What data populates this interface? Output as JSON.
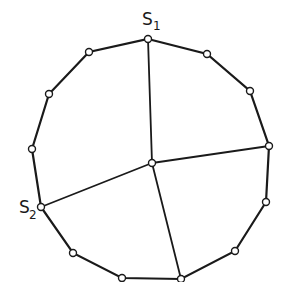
{
  "diagram": {
    "type": "planar-graph",
    "colors": {
      "line": "#1a1a1a",
      "vertex_fill": "#ffffff",
      "background": "#ffffff"
    },
    "labels": {
      "s1": {
        "main": "S",
        "sub": "1"
      },
      "s2": {
        "main": "S",
        "sub": "2"
      }
    },
    "boundary_vertices": [
      {
        "id": "s1",
        "x": 148,
        "y": 39
      },
      {
        "id": "v2",
        "x": 207,
        "y": 54
      },
      {
        "id": "v3",
        "x": 250,
        "y": 91
      },
      {
        "id": "v4",
        "x": 269,
        "y": 146
      },
      {
        "id": "v5",
        "x": 266,
        "y": 202
      },
      {
        "id": "v6",
        "x": 235,
        "y": 251
      },
      {
        "id": "v7",
        "x": 181,
        "y": 279
      },
      {
        "id": "v8",
        "x": 122,
        "y": 278
      },
      {
        "id": "v9",
        "x": 73,
        "y": 253
      },
      {
        "id": "s2",
        "x": 41,
        "y": 207
      },
      {
        "id": "v11",
        "x": 32,
        "y": 149
      },
      {
        "id": "v12",
        "x": 49,
        "y": 94
      },
      {
        "id": "v13",
        "x": 89,
        "y": 52
      }
    ],
    "center_vertex": {
      "id": "c",
      "x": 152,
      "y": 163
    },
    "spokes_to": [
      "s1",
      "v4",
      "v7",
      "s2"
    ]
  }
}
